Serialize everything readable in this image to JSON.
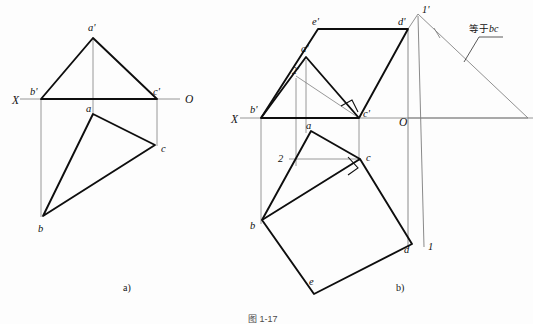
{
  "figure": {
    "title": "",
    "background_color": "#fdfdfd",
    "line_color": "#111111",
    "thin_line_color": "#6a6a6a",
    "sub_captions": [
      {
        "id": "sub-a",
        "text": "a)",
        "x": 123,
        "y": 288
      },
      {
        "id": "sub-b",
        "text": "b)",
        "x": 396,
        "y": 288
      }
    ],
    "bottom_caption": "图 1-17"
  },
  "diagram_a": {
    "name": "projection-diagram-a",
    "axis": {
      "x_label": "X",
      "o_label": "O",
      "x_label_pos": {
        "x": 12,
        "y": 103
      },
      "o_label_pos": {
        "x": 185,
        "y": 102
      },
      "line": {
        "x1": 20,
        "y1": 99,
        "x2": 180,
        "y2": 99
      }
    },
    "points": [
      {
        "id": "a-prime",
        "label": "a'",
        "x": 93,
        "y": 38,
        "label_x": 88,
        "label_y": 30
      },
      {
        "id": "b-prime",
        "label": "b'",
        "x": 41,
        "y": 99,
        "label_x": 33,
        "label_y": 94
      },
      {
        "id": "c-prime",
        "label": "c'",
        "x": 157,
        "y": 99,
        "label_x": 155,
        "label_y": 94
      },
      {
        "id": "a",
        "label": "a",
        "x": 93,
        "y": 114,
        "label_x": 88,
        "label_y": 111
      },
      {
        "id": "b",
        "label": "b",
        "x": 43,
        "y": 216,
        "label_x": 39,
        "label_y": 230
      },
      {
        "id": "c",
        "label": "c",
        "x": 155,
        "y": 145,
        "label_x": 161,
        "label_y": 151
      }
    ],
    "edges": [
      {
        "id": "ap-bp",
        "from": "a-prime",
        "to": "b-prime",
        "weight": "thick"
      },
      {
        "id": "ap-cp",
        "from": "a-prime",
        "to": "c-prime",
        "weight": "thick"
      },
      {
        "id": "bp-cp",
        "from": "b-prime",
        "to": "c-prime",
        "weight": "thick"
      },
      {
        "id": "a-b",
        "from": "a",
        "to": "b",
        "weight": "thick"
      },
      {
        "id": "a-c",
        "from": "a",
        "to": "c",
        "weight": "thick"
      },
      {
        "id": "b-c",
        "from": "b",
        "to": "c",
        "weight": "thick"
      }
    ],
    "projection_lines": [
      {
        "id": "proj-a",
        "x1": 93,
        "y1": 38,
        "x2": 93,
        "y2": 114
      },
      {
        "id": "proj-b",
        "x1": 41,
        "y1": 99,
        "x2": 41,
        "y2": 216
      },
      {
        "id": "proj-c",
        "x1": 157,
        "y1": 99,
        "x2": 157,
        "y2": 145
      }
    ]
  },
  "diagram_b": {
    "name": "projection-diagram-b",
    "axis": {
      "x_label": "X",
      "o_label": "O",
      "x_label_pos": {
        "x": 232,
        "y": 122
      },
      "o_label_pos": {
        "x": 400,
        "y": 124
      },
      "line": {
        "x1": 240,
        "y1": 118,
        "x2": 533,
        "y2": 118
      }
    },
    "points": [
      {
        "id": "e-prime",
        "label": "e'",
        "x": 318,
        "y": 29,
        "label_x": 313,
        "label_y": 25
      },
      {
        "id": "d-prime",
        "label": "d'",
        "x": 408,
        "y": 29,
        "label_x": 399,
        "label_y": 25
      },
      {
        "id": "one-prime",
        "label": "1'",
        "x": 418,
        "y": 14,
        "label_x": 423,
        "label_y": 14
      },
      {
        "id": "a-prime-b",
        "label": "a'",
        "x": 306,
        "y": 57,
        "label_x": 303,
        "label_y": 51
      },
      {
        "id": "two-prime",
        "label": "2'",
        "x": 296,
        "y": 76,
        "label_x": 294,
        "label_y": 73
      },
      {
        "id": "b-prime-b",
        "label": "b'",
        "x": 261,
        "y": 118,
        "label_x": 252,
        "label_y": 112
      },
      {
        "id": "c-prime-b",
        "label": "c'",
        "x": 359,
        "y": 118,
        "label_x": 363,
        "label_y": 114
      },
      {
        "id": "a-b2",
        "label": "a",
        "x": 311,
        "y": 131,
        "label_x": 308,
        "label_y": 128
      },
      {
        "id": "two",
        "label": "2",
        "x": 289,
        "y": 159,
        "label_x": 280,
        "label_y": 160
      },
      {
        "id": "c-b",
        "label": "c",
        "x": 360,
        "y": 159,
        "label_x": 366,
        "label_y": 160
      },
      {
        "id": "b-b",
        "label": "b",
        "x": 262,
        "y": 220,
        "label_x": 252,
        "label_y": 228
      },
      {
        "id": "d-b",
        "label": "d",
        "x": 412,
        "y": 244,
        "label_x": 406,
        "label_y": 251
      },
      {
        "id": "one",
        "label": "1",
        "x": 425,
        "y": 244,
        "label_x": 428,
        "label_y": 248
      },
      {
        "id": "e-b",
        "label": "e",
        "x": 314,
        "y": 294,
        "label_x": 312,
        "label_y": 284
      }
    ],
    "edges": [
      {
        "id": "bp-ep",
        "from": "b-prime-b",
        "to": "e-prime",
        "weight": "thick"
      },
      {
        "id": "ep-dp",
        "from": "e-prime",
        "to": "d-prime",
        "weight": "thick"
      },
      {
        "id": "dp-cp",
        "from": "d-prime",
        "to": "c-prime-b",
        "weight": "thick"
      },
      {
        "id": "cp-bp",
        "from": "c-prime-b",
        "to": "b-prime-b",
        "weight": "thick"
      },
      {
        "id": "bp-ap",
        "from": "b-prime-b",
        "to": "a-prime-b",
        "weight": "thick"
      },
      {
        "id": "ap-cp-b",
        "from": "a-prime-b",
        "to": "c-prime-b",
        "weight": "thick"
      },
      {
        "id": "b-a",
        "from": "b-b",
        "to": "a-b2",
        "weight": "thick"
      },
      {
        "id": "a-c-b",
        "from": "a-b2",
        "to": "c-b",
        "weight": "thick"
      },
      {
        "id": "b-c-b",
        "from": "b-b",
        "to": "c-b",
        "weight": "thin"
      },
      {
        "id": "c-d",
        "from": "c-b",
        "to": "d-b",
        "weight": "thick"
      },
      {
        "id": "d-e",
        "from": "d-b",
        "to": "e-b",
        "weight": "thick"
      },
      {
        "id": "e-b-edge",
        "from": "e-b",
        "to": "b-b",
        "weight": "thick"
      },
      {
        "id": "b-c-quad",
        "from": "b-b",
        "to": "c-b",
        "weight": "thick"
      }
    ],
    "thin_lines": [
      {
        "id": "two-prime-to-cp",
        "x1": 296,
        "y1": 76,
        "x2": 359,
        "y2": 118
      },
      {
        "id": "two-to-c",
        "x1": 289,
        "y1": 159,
        "x2": 360,
        "y2": 159
      },
      {
        "id": "proj-aprime",
        "x1": 306,
        "y1": 57,
        "x2": 306,
        "y2": 131
      },
      {
        "id": "proj-twoprime",
        "x1": 296,
        "y1": 76,
        "x2": 296,
        "y2": 166
      },
      {
        "id": "proj-bprime",
        "x1": 261,
        "y1": 118,
        "x2": 261,
        "y2": 225
      },
      {
        "id": "proj-cprime",
        "x1": 359,
        "y1": 118,
        "x2": 359,
        "y2": 162
      },
      {
        "id": "proj-dprime",
        "x1": 408,
        "y1": 29,
        "x2": 408,
        "y2": 248
      },
      {
        "id": "proj-oneprime",
        "x1": 418,
        "y1": 14,
        "x2": 424,
        "y2": 248
      }
    ],
    "construction": {
      "id": "bc-length-triangle",
      "apex": {
        "x": 418,
        "y": 14
      },
      "left": {
        "x": 408,
        "y": 29
      },
      "right": {
        "x": 528,
        "y": 118
      },
      "tick": {
        "x": 437,
        "y": 33
      }
    },
    "annotation": {
      "id": "equals-bc-note",
      "text_cn": "等于",
      "text_it": "bc",
      "text_full": "等于bc",
      "text_x": 470,
      "text_y": 32,
      "leader": [
        {
          "x": 502,
          "y": 36
        },
        {
          "x": 478,
          "y": 36
        },
        {
          "x": 464,
          "y": 62
        }
      ]
    },
    "right_angle_marks": [
      {
        "id": "right-angle-cprime",
        "x": 349,
        "y": 108,
        "rot": -40
      },
      {
        "id": "right-angle-c",
        "x": 352,
        "y": 164,
        "rot": -42
      }
    ]
  }
}
